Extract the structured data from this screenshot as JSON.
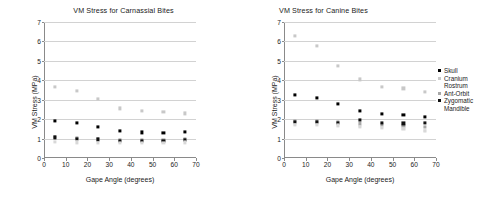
{
  "figure": {
    "xlabel": "Gape Angle (degrees)",
    "ylabel": "VM Stress (MPa)",
    "xticks": [
      "0",
      "10",
      "20",
      "30",
      "40",
      "50",
      "60",
      "70"
    ],
    "yticks": [
      "0",
      "1",
      "2",
      "3",
      "4",
      "5",
      "6",
      "7"
    ]
  },
  "legend": {
    "items": [
      {
        "label": "Skull",
        "color": "#000000",
        "marker": "square",
        "visible_marker": true
      },
      {
        "label": "Cranium",
        "color": "#c8c8c8",
        "marker": "square",
        "visible_marker": true
      },
      {
        "label": "Rostrum",
        "color": "#e8e8e8",
        "marker": "square",
        "visible_marker": false
      },
      {
        "label": "Ant-Orbit",
        "color": "#a8a8a8",
        "marker": "square",
        "visible_marker": true
      },
      {
        "label": "Zygomatic",
        "color": "#111111",
        "marker": "square",
        "visible_marker": true
      },
      {
        "label": "Mandible",
        "color": "#d8d8d8",
        "marker": "square",
        "visible_marker": false
      }
    ]
  },
  "chart_data": [
    {
      "type": "scatter",
      "title": "VM Stress for Carnassial Bites",
      "xlabel": "Gape Angle (degrees)",
      "ylabel": "VM Stress (MPa)",
      "xlim": [
        0,
        70
      ],
      "ylim": [
        0,
        7
      ],
      "xticks": [
        0,
        10,
        20,
        30,
        40,
        50,
        60,
        70
      ],
      "yticks": [
        0,
        1,
        2,
        3,
        4,
        5,
        6,
        7
      ],
      "grid": "horizontal",
      "legend_position": "right-shared",
      "x": [
        5,
        15,
        25,
        35,
        45,
        55,
        65
      ],
      "series": [
        {
          "name": "Skull",
          "color": "#000000",
          "values": [
            1.92,
            1.82,
            1.6,
            1.38,
            1.32,
            1.31,
            1.33
          ]
        },
        {
          "name": "Cranium",
          "color": "#c8c8c8",
          "values": [
            3.68,
            3.45,
            3.05,
            2.55,
            2.42,
            2.36,
            2.3
          ]
        },
        {
          "name": "Rostrum",
          "color": "#e8e8e8",
          "values": [
            1.05,
            1.0,
            0.95,
            0.92,
            0.9,
            0.9,
            0.92
          ]
        },
        {
          "name": "Ant-Orbit",
          "color": "#a8a8a8",
          "values": [
            1.1,
            1.02,
            0.98,
            0.95,
            0.93,
            0.94,
            0.96
          ]
        },
        {
          "name": "Zygomatic",
          "color": "#111111",
          "values": [
            1.06,
            1.0,
            0.96,
            0.88,
            0.86,
            0.9,
            0.95
          ]
        },
        {
          "name": "Mandible",
          "color": "#d8d8d8",
          "values": [
            0.82,
            0.8,
            0.78,
            0.76,
            0.76,
            0.78,
            0.8
          ]
        }
      ]
    },
    {
      "type": "scatter",
      "title": "VM Stress for Canine Bites",
      "xlabel": "Gape Angle (degrees)",
      "ylabel": "VM Stress (MPa)",
      "xlim": [
        0,
        70
      ],
      "ylim": [
        0,
        7
      ],
      "xticks": [
        0,
        10,
        20,
        30,
        40,
        50,
        60,
        70
      ],
      "yticks": [
        0,
        1,
        2,
        3,
        4,
        5,
        6,
        7
      ],
      "grid": "horizontal",
      "legend_position": "right-shared",
      "x": [
        5,
        15,
        25,
        35,
        45,
        55,
        65
      ],
      "series": [
        {
          "name": "Skull",
          "color": "#000000",
          "values": [
            3.25,
            3.08,
            2.77,
            2.42,
            2.27,
            2.2,
            2.12
          ]
        },
        {
          "name": "Cranium",
          "color": "#c8c8c8",
          "values": [
            6.28,
            5.75,
            4.75,
            4.05,
            3.68,
            3.58,
            3.4
          ]
        },
        {
          "name": "Rostrum",
          "color": "#e8e8e8",
          "values": [
            1.78,
            1.75,
            1.72,
            1.65,
            1.6,
            1.52,
            1.42
          ]
        },
        {
          "name": "Ant-Orbit",
          "color": "#a8a8a8",
          "values": [
            1.9,
            1.88,
            1.84,
            1.78,
            1.72,
            1.66,
            1.6
          ]
        },
        {
          "name": "Zygomatic",
          "color": "#111111",
          "values": [
            1.85,
            1.84,
            1.8,
            1.95,
            1.8,
            1.78,
            1.8
          ]
        },
        {
          "name": "Mandible",
          "color": "#d8d8d8",
          "values": [
            1.72,
            1.7,
            1.68,
            1.62,
            1.56,
            1.48,
            1.38
          ]
        }
      ]
    }
  ]
}
